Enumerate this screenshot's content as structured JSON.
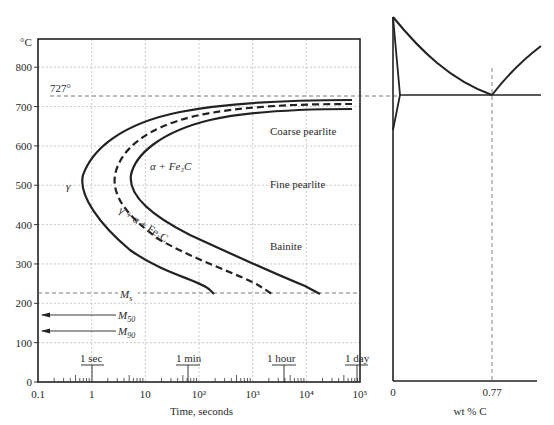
{
  "chart_data": [
    {
      "type": "line",
      "title": "TTT diagram (eutectoid steel)",
      "xlabel": "Time, seconds",
      "ylabel": "°C",
      "xscale": "log",
      "xlim": [
        0.1,
        100000
      ],
      "ylim": [
        0,
        870
      ],
      "grid": true,
      "x_ticks": [
        {
          "value": 0.1,
          "label": "0.1"
        },
        {
          "value": 1,
          "label": "1"
        },
        {
          "value": 10,
          "label": "10"
        },
        {
          "value": 100,
          "label": "10²"
        },
        {
          "value": 1000,
          "label": "10³"
        },
        {
          "value": 10000,
          "label": "10⁴"
        },
        {
          "value": 100000,
          "label": "10⁵"
        }
      ],
      "y_ticks": [
        0,
        100,
        200,
        300,
        400,
        500,
        600,
        700,
        800
      ],
      "time_markers": [
        {
          "label": "1 sec",
          "value": 1
        },
        {
          "label": "1 min",
          "value": 60
        },
        {
          "label": "1 hour",
          "value": 3600
        },
        {
          "label": "1 day",
          "value": 86400
        }
      ],
      "reference_lines": [
        {
          "name": "eutectoid",
          "label": "727°",
          "y": 727,
          "style": "dashed"
        },
        {
          "name": "Ms",
          "label": "Ms",
          "y": 225,
          "style": "dashed"
        },
        {
          "name": "M50",
          "label": "M50",
          "y": 170,
          "style": "arrow"
        },
        {
          "name": "M90",
          "label": "M90",
          "y": 130,
          "style": "arrow"
        }
      ],
      "series": [
        {
          "name": "Transformation start",
          "style": "solid",
          "points": [
            [
              80000,
              700
            ],
            [
              10000,
              695
            ],
            [
              1000,
              680
            ],
            [
              100,
              655
            ],
            [
              10,
              615
            ],
            [
              2,
              570
            ],
            [
              0.8,
              540
            ],
            [
              1,
              490
            ],
            [
              3,
              440
            ],
            [
              10,
              390
            ],
            [
              40,
              330
            ],
            [
              120,
              280
            ],
            [
              190,
              240
            ],
            [
              200,
              225
            ]
          ]
        },
        {
          "name": "50% transformation",
          "style": "dashed",
          "points": [
            [
              80000,
              712
            ],
            [
              10000,
              706
            ],
            [
              1000,
              690
            ],
            [
              100,
              665
            ],
            [
              20,
              630
            ],
            [
              7,
              590
            ],
            [
              4,
              540
            ],
            [
              6,
              490
            ],
            [
              20,
              440
            ],
            [
              80,
              390
            ],
            [
              300,
              340
            ],
            [
              1000,
              290
            ],
            [
              2200,
              250
            ],
            [
              2500,
              225
            ]
          ]
        },
        {
          "name": "Transformation finish",
          "style": "solid",
          "points": [
            [
              80000,
              725
            ],
            [
              10000,
              718
            ],
            [
              1000,
              700
            ],
            [
              150,
              675
            ],
            [
              40,
              640
            ],
            [
              15,
              590
            ],
            [
              9,
              540
            ],
            [
              13,
              490
            ],
            [
              40,
              440
            ],
            [
              150,
              390
            ],
            [
              700,
              340
            ],
            [
              3500,
              290
            ],
            [
              12000,
              250
            ],
            [
              20000,
              225
            ]
          ]
        }
      ],
      "annotations": [
        {
          "text": "γ",
          "x": 0.4,
          "y": 540
        },
        {
          "text": "α + Fe₃C",
          "x": 8,
          "y": 540
        },
        {
          "text": "γ + α + Fe₃C",
          "x": 7,
          "y": 400,
          "rotated": true
        },
        {
          "text": "Coarse pearlite",
          "x": 3000,
          "y": 630
        },
        {
          "text": "Fine pearlite",
          "x": 3000,
          "y": 510
        },
        {
          "text": "Bainite",
          "x": 3000,
          "y": 350
        }
      ]
    },
    {
      "type": "line",
      "title": "Fe–Fe₃C phase diagram (partial)",
      "xlabel": "wt % C",
      "x_ticks": [
        {
          "value": 0,
          "label": "0"
        },
        {
          "value": 0.77,
          "label": "0.77"
        }
      ],
      "eutectoid": {
        "composition": 0.77,
        "temperature": 727
      },
      "grid": false
    }
  ],
  "labels": {
    "y_unit": "°C",
    "x_title": "Time, seconds",
    "eutectoid_temp": "727°",
    "ms": "M",
    "ms_sub": "s",
    "m50": "M",
    "m50_sub": "50",
    "m90": "M",
    "m90_sub": "90",
    "gamma": "γ",
    "alpha_fe3c": "α  + Fe₃C",
    "mixed": "γ + α + Fe₃C",
    "coarse": "Coarse pearlite",
    "fine": "Fine pearlite",
    "bainite": "Bainite",
    "t_sec": "1 sec",
    "t_min": "1 min",
    "t_hour": "1 hour",
    "t_day": "1 day",
    "pd_x0": "0",
    "pd_x077": "0.77",
    "pd_xtitle": "wt % C"
  }
}
